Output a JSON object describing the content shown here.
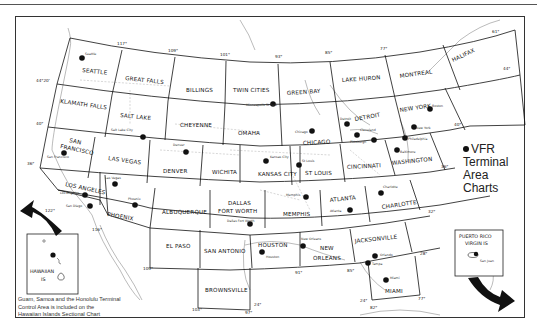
{
  "legend": {
    "marker": "filled-circle",
    "line1": "VFR",
    "line2": "Terminal",
    "line3": "Area",
    "line4": "Charts"
  },
  "note": {
    "line1": "Guam, Samoa and the Honolulu Terminal",
    "line2": "Control Area is included on the",
    "line3": "Hawaiian Islands Sectional Chart"
  },
  "insets": {
    "hawaii": {
      "line1": "HAWAIIAN",
      "line2": "IS"
    },
    "puerto_rico": {
      "line1": "PUERTO RICO",
      "line2": "VIRGIN IS",
      "city": "San Juan"
    }
  },
  "sectionals": [
    "SEATTLE",
    "GREAT FALLS",
    "BILLINGS",
    "TWIN CITIES",
    "GREEN BAY",
    "LAKE HURON",
    "MONTREAL",
    "HALIFAX",
    "KLAMATH FALLS",
    "SALT LAKE",
    "CHEYENNE",
    "OMAHA",
    "CHICAGO",
    "DETROIT",
    "NEW YORK",
    "SAN FRANCISCO",
    "LAS VEGAS",
    "DENVER",
    "WICHITA",
    "KANSAS CITY",
    "ST LOUIS",
    "CINCINNATI",
    "WASHINGTON",
    "LOS ANGELES",
    "PHOENIX",
    "ALBUQUERQUE",
    "DALLAS FORT WORTH",
    "MEMPHIS",
    "ATLANTA",
    "CHARLOTTE",
    "EL PASO",
    "SAN ANTONIO",
    "HOUSTON",
    "NEW ORLEANS",
    "JACKSONVILLE",
    "BROWNSVILLE",
    "MIAMI"
  ],
  "labels": {
    "seattle": "SEATTLE",
    "great_falls": "GREAT FALLS",
    "billings": "BILLINGS",
    "twin_cities": "TWIN CITIES",
    "green_bay": "GREEN BAY",
    "lake_huron": "LAKE HURON",
    "montreal": "MONTREAL",
    "halifax": "HALIFAX",
    "klamath_falls": "KLAMATH FALLS",
    "salt_lake": "SALT LAKE",
    "cheyenne": "CHEYENNE",
    "omaha": "OMAHA",
    "chicago": "CHICAGO",
    "detroit": "DETROIT",
    "new_york": "NEW YORK",
    "san": "SAN",
    "francisco": "FRANCISCO",
    "las_vegas": "LAS VEGAS",
    "denver": "DENVER",
    "wichita": "WICHITA",
    "kansas_city": "KANSAS CITY",
    "st_louis": "ST LOUIS",
    "cincinnati": "CINCINNATI",
    "washington": "WASHINGTON",
    "los_angeles": "LOS ANGELES",
    "phoenix": "PHOENIX",
    "albuquerque": "ALBUQUERQUE",
    "dallas": "DALLAS",
    "fort_worth": "FORT WORTH",
    "memphis": "MEMPHIS",
    "atlanta": "ATLANTA",
    "charlotte": "CHARLOTTE",
    "el_paso": "EL PASO",
    "san_antonio": "SAN ANTONIO",
    "houston": "HOUSTON",
    "new": "NEW",
    "orleans": "ORLEANS",
    "jacksonville": "JACKSONVILLE",
    "brownsville": "BROWNSVILLE",
    "miami": "MIAMI"
  },
  "terminal_areas": {
    "seattle": "Seattle",
    "salt_lake_city": "Salt Lake City",
    "denver": "Denver",
    "minneapolis": "Minneapolis St Paul",
    "chicago": "Chicago",
    "detroit": "Detroit",
    "cleveland": "Cleveland",
    "pittsburgh": "Pittsburgh",
    "boston": "Boston",
    "new_york": "New York",
    "philadelphia": "Philadelphia",
    "baltimore": "Baltimore",
    "san_francisco": "San Francisco",
    "las_vegas": "Las Vegas",
    "los_angeles": "Los Angeles",
    "san_diego": "San Diego",
    "phoenix": "Phoenix",
    "kansas_city": "Kansas City",
    "st_louis": "St Louis",
    "dallas": "Dallas Fort Worth",
    "memphis": "Memphis",
    "atlanta": "Atlanta",
    "charlotte": "Charlotte",
    "houston": "Houston",
    "new_orleans": "New Orleans",
    "orlando": "Orlando",
    "tampa": "Tampa",
    "miami": "Miami"
  },
  "degrees": {
    "d117": "117°",
    "d109": "109°",
    "d101": "101°",
    "d93": "93°",
    "d85": "85°",
    "d77": "77°",
    "d69": "69°",
    "d61": "61°",
    "d44n": "44°",
    "d44_20": "44°20'",
    "d40w": "40°",
    "d40e": "40°",
    "d36w": "36°",
    "d36e": "36°",
    "d122": "122°",
    "d116": "116°",
    "d109s": "109°",
    "d103": "103°",
    "d97": "97°",
    "d24a": "24°",
    "d91": "91°",
    "d85s": "85°",
    "d32": "32°",
    "d28": "28°",
    "d24b": "24°",
    "d82": "82°",
    "d77s": "77°"
  }
}
